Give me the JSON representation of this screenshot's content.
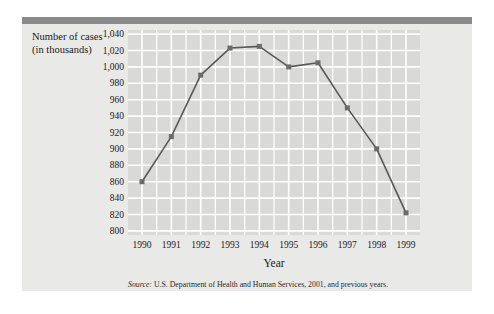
{
  "figure": {
    "y_axis_title": "Number of cases (in thousands)",
    "x_axis_title": "Year",
    "source_label": "Source:",
    "source_text": " U.S. Department of Health and Human Services, 2001, and previous years.",
    "top_bar_color": "#8a8a8a",
    "panel_color": "#e9e9e7",
    "plot_color": "#d9d9d7",
    "grid_color": "#ffffff",
    "series_color": "#595959",
    "marker_color": "#6b6b6b"
  },
  "chart_data": {
    "type": "line",
    "title": "",
    "xlabel": "Year",
    "ylabel": "Number of cases (in thousands)",
    "categories": [
      "1990",
      "1991",
      "1992",
      "1993",
      "1994",
      "1995",
      "1996",
      "1997",
      "1998",
      "1999"
    ],
    "x": [
      1990,
      1991,
      1992,
      1993,
      1994,
      1995,
      1996,
      1997,
      1998,
      1999
    ],
    "values": [
      860,
      915,
      990,
      1023,
      1025,
      1000,
      1005,
      950,
      900,
      822
    ],
    "ylim": [
      795,
      1045
    ],
    "yticks": [
      "1,040",
      "1,020",
      "1,000",
      "980",
      "960",
      "940",
      "920",
      "900",
      "880",
      "860",
      "840",
      "820",
      "800"
    ],
    "ytick_values": [
      1040,
      1020,
      1000,
      980,
      960,
      940,
      920,
      900,
      880,
      860,
      840,
      820,
      800
    ],
    "grid": "both",
    "legend": "none",
    "markers": "square"
  }
}
